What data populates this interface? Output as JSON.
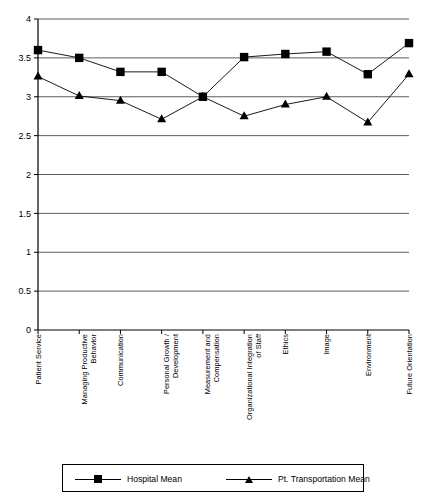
{
  "chart_data": {
    "type": "line",
    "title": "",
    "subtitle": "",
    "xlabel": "",
    "ylabel": "",
    "ylim": [
      0,
      4
    ],
    "ytick_step": 0.5,
    "yticks": [
      "0",
      "0.5",
      "1",
      "1.5",
      "2",
      "2.5",
      "3",
      "3.5",
      "4"
    ],
    "grid": "horizontal",
    "legend_position": "bottom",
    "categories": [
      "Patient Service",
      "Managing Productive Behavior",
      "Communication",
      "Personal Growth / Development",
      "Measurement and Compensation",
      "Organizational Integration of Staff",
      "Ethics",
      "Image",
      "Environment",
      "Future Orientation"
    ],
    "category_lines": [
      [
        "Patient Service"
      ],
      [
        "Managing Productive",
        "Behavior"
      ],
      [
        "Communication"
      ],
      [
        "Personal Growth /",
        "Development"
      ],
      [
        "Measurement and",
        "Compensation"
      ],
      [
        "Organizational Integration",
        "of Staff"
      ],
      [
        "Ethics"
      ],
      [
        "Image"
      ],
      [
        "Environment"
      ],
      [
        "Future Orientation"
      ]
    ],
    "series": [
      {
        "name": "Hospital Mean",
        "marker": "square",
        "color": "#000000",
        "values": [
          3.6,
          3.5,
          3.32,
          3.32,
          3.0,
          3.51,
          3.55,
          3.58,
          3.29,
          3.69
        ]
      },
      {
        "name": "Pt. Transportation Mean",
        "marker": "triangle",
        "color": "#000000",
        "values": [
          3.26,
          3.01,
          2.95,
          2.71,
          3.0,
          2.75,
          2.9,
          3.0,
          2.67,
          3.29
        ]
      }
    ]
  },
  "legend": {
    "items": [
      {
        "label": "Hospital Mean",
        "marker": "square-marker-icon"
      },
      {
        "label": "Pt. Transportation Mean",
        "marker": "triangle-marker-icon"
      }
    ]
  }
}
